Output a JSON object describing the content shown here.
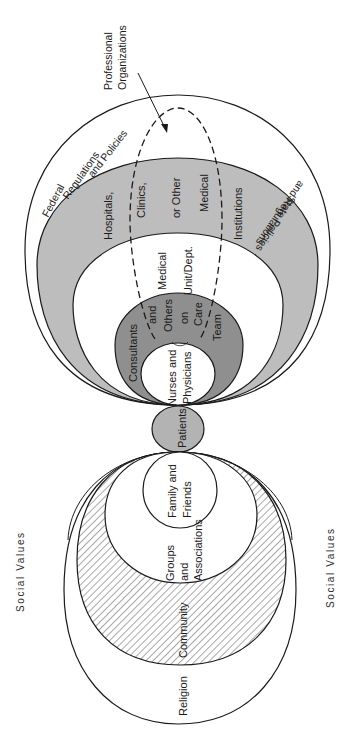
{
  "diagram": {
    "orientation": "rotated-90-ccw",
    "colors": {
      "stroke": "#1a1a1a",
      "gray_band": "#bdbdbd",
      "dark_band": "#8f8f8f",
      "patients_fill": "#b3b3b3",
      "hatch": "#a8a8a8",
      "background": "#ffffff"
    },
    "labels": {
      "social_values_left": "Social Values",
      "social_values_right": "Social Values",
      "professional_organizations": [
        "Professional",
        "Organizations"
      ],
      "federal": [
        "Federal",
        "Regulations",
        "and Policies"
      ],
      "state": [
        "State Policies",
        "and Regulations"
      ],
      "institutions": [
        "Hospitals,",
        "Clinics,",
        "or Other",
        "Medical",
        "Institutions"
      ],
      "unit": [
        "Medical",
        "Unit/Dept."
      ],
      "care_team": [
        "Consultants",
        "and",
        "Others",
        "on",
        "Care",
        "Team"
      ],
      "nurses": [
        "Nurses and",
        "Physicians"
      ],
      "patients": "Patients",
      "family": [
        "Family and",
        "Friends"
      ],
      "groups": [
        "Groups",
        "and",
        "Associations"
      ],
      "community": "Community",
      "religion": "Religion"
    }
  }
}
